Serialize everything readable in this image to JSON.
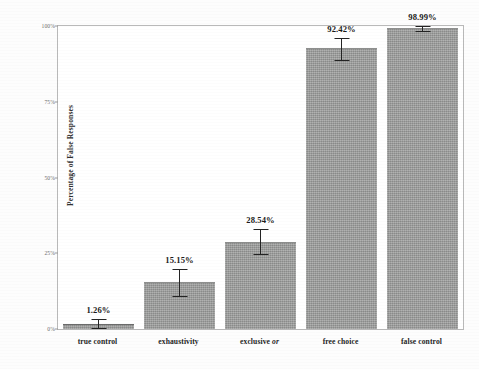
{
  "chart_data": {
    "type": "bar",
    "title": "",
    "xlabel": "",
    "ylabel": "Percentage of False Responses",
    "ylim": [
      0,
      100
    ],
    "grid": false,
    "legend": "none",
    "categories": [
      "true control",
      "exhaustivity",
      "exclusive or",
      "free choice",
      "false control"
    ],
    "category_html": [
      "true control",
      "exhaustivity",
      "exclusive <i>or</i>",
      "free choice",
      "false control"
    ],
    "values": [
      1.26,
      15.15,
      28.54,
      92.42,
      98.99
    ],
    "value_labels": [
      "1.26%",
      "15.15%",
      "28.54%",
      "92.42%",
      "98.99%"
    ],
    "error_low": [
      0.1,
      10.6,
      24.3,
      88.6,
      97.9
    ],
    "error_high": [
      3.2,
      19.7,
      33.1,
      95.9,
      100.0
    ],
    "ytick_values": [
      0,
      25,
      50,
      75,
      100
    ],
    "ytick_labels": [
      "0%",
      "25%",
      "50%",
      "75%",
      "100%"
    ],
    "bar_color": "#9b9c9b",
    "error_bar_color": "#232323",
    "axis_color": "#b9b9b9",
    "label_color": "#1b1b1b"
  },
  "axes": {
    "y_title": "Percentage of False Responses"
  }
}
